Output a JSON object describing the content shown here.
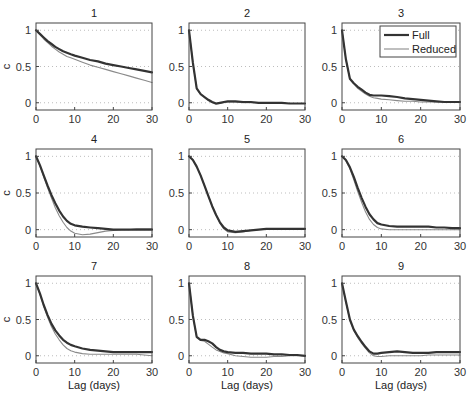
{
  "figure": {
    "xlabel": "Lag (days)",
    "ylabel": "c",
    "legend": {
      "entries": [
        {
          "label": "Full",
          "style": "thick-dark"
        },
        {
          "label": "Reduced",
          "style": "thin-gray"
        }
      ],
      "panel": 3
    },
    "colors": {
      "full": "#333333",
      "reduced": "#8a8a8a",
      "axes": "#444444",
      "grid": "#bdbdbd"
    }
  },
  "chart_data": {
    "type": "line",
    "layout": "3x3 grid of subplots",
    "xlabel": "Lag (days)",
    "ylabel": "c",
    "xlim": [
      0,
      30
    ],
    "ylim": [
      -0.1,
      1.1
    ],
    "xticks": [
      0,
      10,
      20,
      30
    ],
    "yticks": [
      0,
      0.5,
      1
    ],
    "grid": "dotted horizontal at y ticks",
    "legend": {
      "entries": [
        "Full",
        "Reduced"
      ],
      "position": "upper right of panel 3"
    },
    "x": [
      0,
      1,
      2,
      3,
      4,
      5,
      6,
      7,
      8,
      9,
      10,
      12,
      14,
      16,
      18,
      20,
      22,
      24,
      26,
      28,
      30
    ],
    "panels": [
      {
        "title": "1",
        "series": [
          {
            "name": "Full",
            "values": [
              1.0,
              0.95,
              0.9,
              0.85,
              0.81,
              0.77,
              0.74,
              0.71,
              0.69,
              0.67,
              0.65,
              0.62,
              0.59,
              0.57,
              0.54,
              0.52,
              0.5,
              0.48,
              0.46,
              0.44,
              0.42
            ]
          },
          {
            "name": "Reduced",
            "values": [
              1.0,
              0.94,
              0.88,
              0.83,
              0.78,
              0.74,
              0.7,
              0.67,
              0.64,
              0.62,
              0.6,
              0.56,
              0.52,
              0.49,
              0.46,
              0.43,
              0.4,
              0.37,
              0.34,
              0.31,
              0.28
            ]
          }
        ]
      },
      {
        "title": "2",
        "series": [
          {
            "name": "Full",
            "values": [
              1.0,
              0.55,
              0.2,
              0.12,
              0.08,
              0.04,
              0.01,
              -0.01,
              0.0,
              0.01,
              0.02,
              0.02,
              0.01,
              0.01,
              0.0,
              0.0,
              0.0,
              0.0,
              -0.01,
              -0.01,
              -0.01
            ]
          },
          {
            "name": "Reduced",
            "values": [
              1.0,
              0.55,
              0.19,
              0.11,
              0.07,
              0.03,
              0.0,
              -0.02,
              -0.01,
              0.0,
              0.01,
              0.01,
              0.0,
              0.0,
              0.0,
              -0.01,
              -0.01,
              -0.01,
              -0.01,
              -0.01,
              -0.01
            ]
          }
        ]
      },
      {
        "title": "3",
        "series": [
          {
            "name": "Full",
            "values": [
              1.0,
              0.6,
              0.33,
              0.27,
              0.22,
              0.18,
              0.14,
              0.11,
              0.1,
              0.1,
              0.1,
              0.09,
              0.08,
              0.06,
              0.05,
              0.04,
              0.03,
              0.02,
              0.01,
              0.01,
              0.01
            ]
          },
          {
            "name": "Reduced",
            "values": [
              1.0,
              0.6,
              0.32,
              0.26,
              0.2,
              0.16,
              0.12,
              0.09,
              0.07,
              0.06,
              0.05,
              0.04,
              0.03,
              0.02,
              0.02,
              0.01,
              0.01,
              0.01,
              0.01,
              0.01,
              0.01
            ]
          }
        ]
      },
      {
        "title": "4",
        "series": [
          {
            "name": "Full",
            "values": [
              1.0,
              0.88,
              0.74,
              0.6,
              0.47,
              0.36,
              0.26,
              0.18,
              0.12,
              0.08,
              0.06,
              0.04,
              0.03,
              0.02,
              0.01,
              0.0,
              0.0,
              0.0,
              0.0,
              0.0,
              0.0
            ]
          },
          {
            "name": "Reduced",
            "values": [
              1.0,
              0.87,
              0.72,
              0.57,
              0.43,
              0.3,
              0.19,
              0.1,
              0.03,
              -0.02,
              -0.05,
              -0.07,
              -0.06,
              -0.04,
              -0.02,
              -0.01,
              0.0,
              0.0,
              0.01,
              0.01,
              0.01
            ]
          }
        ]
      },
      {
        "title": "5",
        "series": [
          {
            "name": "Full",
            "values": [
              1.0,
              0.95,
              0.86,
              0.74,
              0.6,
              0.46,
              0.32,
              0.2,
              0.1,
              0.03,
              -0.01,
              -0.03,
              -0.02,
              -0.01,
              0.0,
              0.01,
              0.01,
              0.01,
              0.01,
              0.01,
              0.01
            ]
          },
          {
            "name": "Reduced",
            "values": [
              1.0,
              0.95,
              0.86,
              0.74,
              0.6,
              0.46,
              0.32,
              0.2,
              0.09,
              0.01,
              -0.03,
              -0.04,
              -0.03,
              -0.01,
              0.0,
              0.01,
              0.01,
              0.01,
              0.01,
              0.01,
              0.01
            ]
          }
        ]
      },
      {
        "title": "6",
        "series": [
          {
            "name": "Full",
            "values": [
              1.0,
              0.95,
              0.85,
              0.72,
              0.57,
              0.43,
              0.31,
              0.21,
              0.14,
              0.09,
              0.07,
              0.05,
              0.04,
              0.04,
              0.04,
              0.04,
              0.04,
              0.03,
              0.03,
              0.02,
              0.02
            ]
          },
          {
            "name": "Reduced",
            "values": [
              1.0,
              0.94,
              0.83,
              0.68,
              0.52,
              0.37,
              0.24,
              0.14,
              0.07,
              0.03,
              0.01,
              0.0,
              0.0,
              0.0,
              0.0,
              0.0,
              0.0,
              0.0,
              0.0,
              0.0,
              0.0
            ]
          }
        ]
      },
      {
        "title": "7",
        "series": [
          {
            "name": "Full",
            "values": [
              1.0,
              0.86,
              0.7,
              0.56,
              0.44,
              0.35,
              0.28,
              0.22,
              0.18,
              0.15,
              0.13,
              0.1,
              0.08,
              0.07,
              0.06,
              0.05,
              0.05,
              0.05,
              0.05,
              0.05,
              0.05
            ]
          },
          {
            "name": "Reduced",
            "values": [
              1.0,
              0.85,
              0.68,
              0.53,
              0.4,
              0.3,
              0.22,
              0.15,
              0.1,
              0.07,
              0.05,
              0.03,
              0.02,
              0.02,
              0.02,
              0.02,
              0.02,
              0.02,
              0.02,
              0.01,
              0.0
            ]
          }
        ]
      },
      {
        "title": "8",
        "series": [
          {
            "name": "Full",
            "values": [
              1.0,
              0.55,
              0.26,
              0.22,
              0.22,
              0.2,
              0.17,
              0.12,
              0.08,
              0.06,
              0.05,
              0.04,
              0.04,
              0.03,
              0.03,
              0.03,
              0.02,
              0.02,
              0.01,
              0.01,
              0.0
            ]
          },
          {
            "name": "Reduced",
            "values": [
              1.0,
              0.55,
              0.25,
              0.21,
              0.2,
              0.16,
              0.12,
              0.08,
              0.06,
              0.04,
              0.03,
              0.0,
              -0.01,
              -0.02,
              -0.02,
              -0.02,
              -0.01,
              -0.01,
              0.0,
              0.0,
              0.0
            ]
          }
        ]
      },
      {
        "title": "9",
        "series": [
          {
            "name": "Full",
            "values": [
              1.0,
              0.75,
              0.5,
              0.36,
              0.27,
              0.19,
              0.12,
              0.06,
              0.03,
              0.03,
              0.04,
              0.05,
              0.06,
              0.05,
              0.04,
              0.04,
              0.04,
              0.05,
              0.05,
              0.05,
              0.05
            ]
          },
          {
            "name": "Reduced",
            "values": [
              1.0,
              0.74,
              0.49,
              0.35,
              0.25,
              0.17,
              0.1,
              0.04,
              0.0,
              -0.01,
              -0.01,
              0.0,
              0.0,
              0.0,
              0.0,
              0.0,
              0.01,
              0.01,
              0.01,
              0.01,
              0.01
            ]
          }
        ]
      }
    ]
  }
}
